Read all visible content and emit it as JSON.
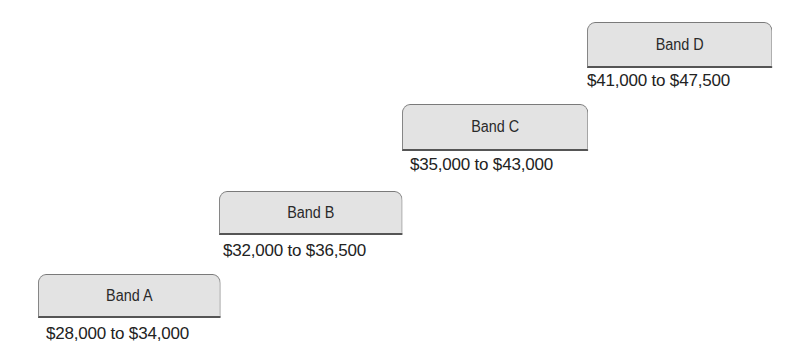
{
  "diagram": {
    "type": "staircase-salary-bands",
    "bands": [
      {
        "label": "Band A",
        "range": "$28,000 to $34,000"
      },
      {
        "label": "Band B",
        "range": "$32,000 to $36,500"
      },
      {
        "label": "Band C",
        "range": "$35,000 to $43,000"
      },
      {
        "label": "Band D",
        "range": "$41,000 to $47,500"
      }
    ]
  },
  "colors": {
    "box_fill": "#e3e3e3",
    "box_border": "#7a7a7a",
    "text": "#222222"
  }
}
